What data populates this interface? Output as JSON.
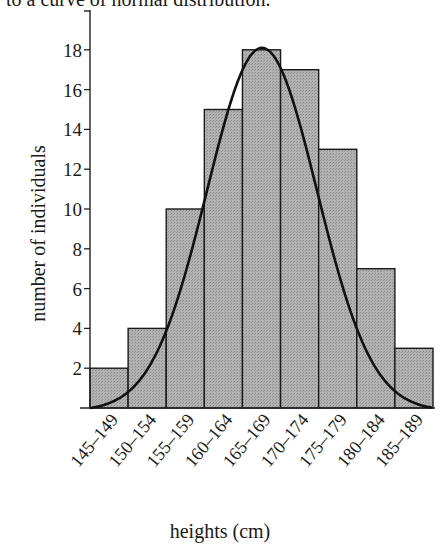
{
  "caption": "to a curve of normal distribution.",
  "chart_data": {
    "type": "bar",
    "subtype": "histogram with fitted normal curve",
    "title": "",
    "xlabel": "heights (cm)",
    "ylabel": "number of individuals",
    "categories": [
      "145–149",
      "150–154",
      "155–159",
      "160–164",
      "165–169",
      "170–174",
      "175–179",
      "180–184",
      "185–189"
    ],
    "values": [
      2,
      4,
      10,
      15,
      18,
      17,
      13,
      7,
      3
    ],
    "yticks": [
      2,
      4,
      6,
      8,
      10,
      12,
      14,
      16,
      18
    ],
    "ylim": [
      0,
      20
    ],
    "grid": false,
    "legend": null,
    "overlay": {
      "type": "line",
      "name": "normal distribution curve"
    },
    "colors": {
      "bar_fill": "#a9a9a9",
      "bar_edge": "#1a1a1a",
      "curve": "#111111"
    }
  }
}
